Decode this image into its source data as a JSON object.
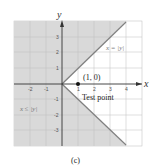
{
  "figure": {
    "caption": "(c)",
    "axes": {
      "x_label": "x",
      "y_label": "y"
    },
    "x_ticks": [
      "-2",
      "-1",
      "1",
      "2",
      "3",
      "4"
    ],
    "y_ticks": [
      "3",
      "2",
      "1",
      "-1",
      "-2",
      "-3"
    ],
    "boundary_label": "x = |y|",
    "region_label": "x ≤ |y|",
    "point_label": "(1, 0)",
    "test_point_label": "Test point",
    "colors": {
      "shaded": "#d9d9d9",
      "grid": "#bfbfbf",
      "boundary": "#808080",
      "axis": "#333333"
    }
  }
}
